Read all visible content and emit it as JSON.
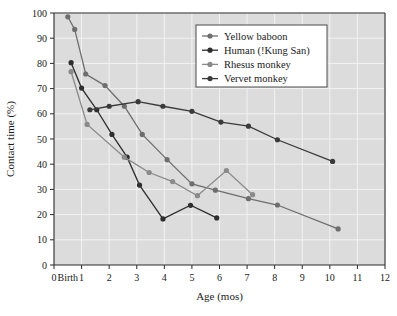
{
  "chart_data": {
    "type": "line",
    "title": "",
    "xlabel": "Age (mos)",
    "ylabel": "Contact time (%)",
    "xlim": [
      0,
      12
    ],
    "ylim": [
      0,
      100
    ],
    "grid": true,
    "legend_position": "top-right",
    "x_tick_labels": [
      "0",
      "Birth",
      "1",
      "2",
      "3",
      "4",
      "5",
      "6",
      "7",
      "8",
      "9",
      "10",
      "11",
      "12"
    ],
    "x_tick_values": [
      0,
      0.5,
      1,
      2,
      3,
      4,
      5,
      6,
      7,
      8,
      9,
      10,
      11,
      12
    ],
    "y_tick_labels": [
      "0",
      "10",
      "20",
      "30",
      "40",
      "50",
      "60",
      "70",
      "80",
      "90",
      "100"
    ],
    "y_tick_values": [
      0,
      10,
      20,
      30,
      40,
      50,
      60,
      70,
      80,
      90,
      100
    ],
    "series": [
      {
        "name": "Yellow baboon",
        "color": "#6e6e6e",
        "points": [
          {
            "x": 0.5,
            "y": 98.5
          },
          {
            "x": 0.75,
            "y": 93.5
          },
          {
            "x": 1.15,
            "y": 75.8
          },
          {
            "x": 1.85,
            "y": 71.2
          },
          {
            "x": 2.55,
            "y": 63.0
          },
          {
            "x": 3.2,
            "y": 51.8
          },
          {
            "x": 4.1,
            "y": 41.8
          },
          {
            "x": 5.0,
            "y": 32.2
          },
          {
            "x": 5.85,
            "y": 29.7
          },
          {
            "x": 7.05,
            "y": 26.3
          },
          {
            "x": 8.1,
            "y": 23.8
          },
          {
            "x": 10.3,
            "y": 14.3
          }
        ]
      },
      {
        "name": "Human (!Kung San)",
        "color": "#2e2e2e",
        "points": [
          {
            "x": 0.62,
            "y": 80.3
          },
          {
            "x": 1.0,
            "y": 70.2
          },
          {
            "x": 1.55,
            "y": 61.6
          },
          {
            "x": 2.1,
            "y": 51.8
          },
          {
            "x": 2.65,
            "y": 42.8
          },
          {
            "x": 3.1,
            "y": 31.7
          },
          {
            "x": 3.95,
            "y": 18.3
          },
          {
            "x": 4.95,
            "y": 23.7
          },
          {
            "x": 5.9,
            "y": 18.7
          }
        ]
      },
      {
        "name": "Rhesus monkey",
        "color": "#8a8a8a",
        "points": [
          {
            "x": 0.62,
            "y": 76.7
          },
          {
            "x": 1.2,
            "y": 55.8
          },
          {
            "x": 2.55,
            "y": 42.8
          },
          {
            "x": 3.45,
            "y": 36.7
          },
          {
            "x": 4.3,
            "y": 33.1
          },
          {
            "x": 5.2,
            "y": 27.5
          },
          {
            "x": 6.25,
            "y": 37.5
          },
          {
            "x": 7.2,
            "y": 27.9
          }
        ]
      },
      {
        "name": "Vervet monkey",
        "color": "#3a3a3a",
        "points": [
          {
            "x": 1.3,
            "y": 61.6
          },
          {
            "x": 2.0,
            "y": 63.0
          },
          {
            "x": 3.05,
            "y": 64.8
          },
          {
            "x": 3.95,
            "y": 63.0
          },
          {
            "x": 5.0,
            "y": 61.0
          },
          {
            "x": 6.05,
            "y": 56.7
          },
          {
            "x": 7.05,
            "y": 55.1
          },
          {
            "x": 8.1,
            "y": 49.7
          },
          {
            "x": 10.1,
            "y": 41.1
          }
        ]
      }
    ]
  },
  "legend": {
    "entries": [
      {
        "label": "Yellow baboon"
      },
      {
        "label": "Human (!Kung San)"
      },
      {
        "label": "Rhesus monkey"
      },
      {
        "label": "Vervet monkey"
      }
    ]
  }
}
